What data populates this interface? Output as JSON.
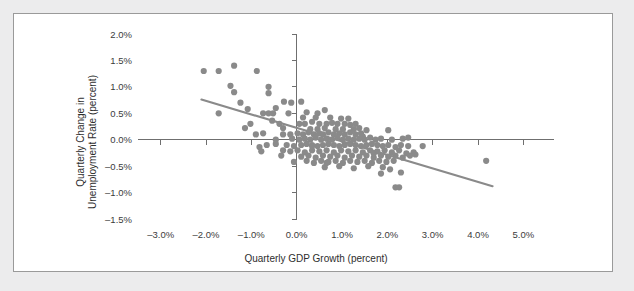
{
  "chart_data": {
    "type": "scatter",
    "title": "",
    "xlabel": "Quarterly GDP Growth (percent)",
    "ylabel_line1": "Quarterly Change in",
    "ylabel_line2": "Unemployment Rate (percent)",
    "xlim": [
      -3.5,
      5.5
    ],
    "ylim": [
      -1.5,
      2.0
    ],
    "grid": false,
    "legend": "none",
    "xticks": [
      -3.0,
      -2.0,
      -1.0,
      0.0,
      1.0,
      2.0,
      3.0,
      4.0,
      5.0
    ],
    "xtick_labels": [
      "–3.0%",
      "–2.0%",
      "–1.0%",
      "0.0%",
      "1.0%",
      "2.0%",
      "3.0%",
      "4.0%",
      "5.0%"
    ],
    "yticks": [
      -1.5,
      -1.0,
      -0.5,
      0.0,
      0.5,
      1.0,
      1.5,
      2.0
    ],
    "ytick_labels": [
      "–1.5%",
      "–1.0%",
      "–0.5%",
      "0.0%",
      "0.5%",
      "1.0%",
      "1.5%",
      "2.0%"
    ],
    "marker_color": "#8a8a8a",
    "marker_size": 3.1,
    "axis_color": "#6f6f6f",
    "trendline": {
      "color": "#8a8a8a",
      "x_start": -2.1,
      "y_start": 0.76,
      "x_end": 4.32,
      "y_end": -0.88
    },
    "points": [
      [
        -2.05,
        1.3
      ],
      [
        -1.72,
        1.3
      ],
      [
        -1.38,
        1.4
      ],
      [
        -0.88,
        1.3
      ],
      [
        -1.46,
        1.02
      ],
      [
        -1.38,
        0.9
      ],
      [
        -0.62,
        1.0
      ],
      [
        -0.62,
        0.88
      ],
      [
        -1.24,
        0.7
      ],
      [
        -0.28,
        0.72
      ],
      [
        -0.12,
        0.7
      ],
      [
        0.1,
        0.72
      ],
      [
        -1.72,
        0.5
      ],
      [
        -1.08,
        0.58
      ],
      [
        -0.74,
        0.5
      ],
      [
        -0.62,
        0.5
      ],
      [
        -0.52,
        0.5
      ],
      [
        -0.18,
        0.5
      ],
      [
        0.22,
        0.52
      ],
      [
        0.46,
        0.5
      ],
      [
        0.62,
        0.56
      ],
      [
        -1.02,
        0.3
      ],
      [
        -0.38,
        0.3
      ],
      [
        -0.3,
        0.22
      ],
      [
        0.06,
        0.3
      ],
      [
        0.18,
        0.3
      ],
      [
        0.34,
        0.34
      ],
      [
        0.5,
        0.3
      ],
      [
        0.66,
        0.3
      ],
      [
        0.78,
        0.32
      ],
      [
        0.9,
        0.3
      ],
      [
        1.06,
        0.3
      ],
      [
        1.18,
        0.28
      ],
      [
        1.3,
        0.3
      ],
      [
        0.42,
        0.42
      ],
      [
        0.74,
        0.42
      ],
      [
        0.98,
        0.4
      ],
      [
        1.14,
        0.4
      ],
      [
        -0.9,
        0.1
      ],
      [
        -0.74,
        0.12
      ],
      [
        -0.3,
        0.1
      ],
      [
        -0.14,
        0.1
      ],
      [
        0.02,
        0.12
      ],
      [
        0.14,
        0.1
      ],
      [
        0.26,
        0.14
      ],
      [
        0.38,
        0.1
      ],
      [
        0.5,
        0.12
      ],
      [
        0.58,
        0.1
      ],
      [
        0.7,
        0.14
      ],
      [
        0.82,
        0.1
      ],
      [
        0.94,
        0.12
      ],
      [
        1.06,
        0.1
      ],
      [
        1.18,
        0.14
      ],
      [
        1.3,
        0.1
      ],
      [
        1.42,
        0.12
      ],
      [
        1.54,
        0.18
      ],
      [
        0.3,
        0.2
      ],
      [
        0.46,
        0.2
      ],
      [
        0.62,
        0.22
      ],
      [
        0.86,
        0.2
      ],
      [
        1.02,
        0.2
      ],
      [
        1.26,
        0.2
      ],
      [
        1.38,
        0.22
      ],
      [
        2.02,
        0.18
      ],
      [
        -0.1,
        0.02
      ],
      [
        0.06,
        0.0
      ],
      [
        0.18,
        0.02
      ],
      [
        0.3,
        0.0
      ],
      [
        0.42,
        0.04
      ],
      [
        0.54,
        0.0
      ],
      [
        0.66,
        0.02
      ],
      [
        0.78,
        0.0
      ],
      [
        0.9,
        0.04
      ],
      [
        1.02,
        0.0
      ],
      [
        1.14,
        0.02
      ],
      [
        1.26,
        0.0
      ],
      [
        1.38,
        0.02
      ],
      [
        1.5,
        0.0
      ],
      [
        1.62,
        0.04
      ],
      [
        1.74,
        0.0
      ],
      [
        1.86,
        0.02
      ],
      [
        2.1,
        0.0
      ],
      [
        2.34,
        0.02
      ],
      [
        -0.46,
        0.0
      ],
      [
        -0.66,
        -0.1
      ],
      [
        -0.46,
        -0.08
      ],
      [
        -0.22,
        -0.1
      ],
      [
        -0.06,
        -0.12
      ],
      [
        0.1,
        -0.1
      ],
      [
        0.22,
        -0.08
      ],
      [
        0.34,
        -0.1
      ],
      [
        0.46,
        -0.12
      ],
      [
        0.58,
        -0.1
      ],
      [
        0.7,
        -0.08
      ],
      [
        0.82,
        -0.1
      ],
      [
        0.94,
        -0.12
      ],
      [
        1.06,
        -0.1
      ],
      [
        1.18,
        -0.08
      ],
      [
        1.3,
        -0.1
      ],
      [
        1.42,
        -0.12
      ],
      [
        1.54,
        -0.1
      ],
      [
        1.66,
        -0.08
      ],
      [
        1.78,
        -0.1
      ],
      [
        1.9,
        -0.12
      ],
      [
        2.02,
        -0.1
      ],
      [
        2.18,
        -0.14
      ],
      [
        2.3,
        -0.1
      ],
      [
        2.46,
        -0.12
      ],
      [
        2.78,
        -0.12
      ],
      [
        -0.78,
        -0.22
      ],
      [
        -0.3,
        -0.2
      ],
      [
        -0.14,
        -0.22
      ],
      [
        0.02,
        -0.2
      ],
      [
        0.18,
        -0.24
      ],
      [
        0.34,
        -0.2
      ],
      [
        0.5,
        -0.22
      ],
      [
        0.66,
        -0.2
      ],
      [
        0.82,
        -0.24
      ],
      [
        0.98,
        -0.2
      ],
      [
        1.14,
        -0.22
      ],
      [
        1.3,
        -0.2
      ],
      [
        1.46,
        -0.24
      ],
      [
        1.62,
        -0.2
      ],
      [
        1.78,
        -0.22
      ],
      [
        1.94,
        -0.2
      ],
      [
        2.1,
        -0.24
      ],
      [
        2.26,
        -0.2
      ],
      [
        2.42,
        -0.26
      ],
      [
        2.58,
        -0.24
      ],
      [
        0.1,
        -0.32
      ],
      [
        0.26,
        -0.3
      ],
      [
        0.42,
        -0.34
      ],
      [
        0.58,
        -0.3
      ],
      [
        0.74,
        -0.32
      ],
      [
        0.9,
        -0.3
      ],
      [
        1.06,
        -0.34
      ],
      [
        1.22,
        -0.3
      ],
      [
        1.38,
        -0.32
      ],
      [
        1.54,
        -0.3
      ],
      [
        1.7,
        -0.34
      ],
      [
        1.86,
        -0.3
      ],
      [
        2.02,
        -0.32
      ],
      [
        2.18,
        -0.3
      ],
      [
        2.34,
        -0.34
      ],
      [
        2.5,
        -0.3
      ],
      [
        4.18,
        -0.4
      ],
      [
        -0.06,
        -0.42
      ],
      [
        0.22,
        -0.4
      ],
      [
        0.38,
        -0.44
      ],
      [
        0.54,
        -0.4
      ],
      [
        0.7,
        -0.42
      ],
      [
        0.86,
        -0.4
      ],
      [
        1.02,
        -0.44
      ],
      [
        1.18,
        -0.4
      ],
      [
        1.34,
        -0.42
      ],
      [
        1.5,
        -0.4
      ],
      [
        1.66,
        -0.44
      ],
      [
        1.82,
        -0.4
      ],
      [
        1.98,
        -0.42
      ],
      [
        2.14,
        -0.4
      ],
      [
        0.62,
        -0.52
      ],
      [
        0.94,
        -0.5
      ],
      [
        1.26,
        -0.54
      ],
      [
        1.58,
        -0.5
      ],
      [
        1.9,
        -0.52
      ],
      [
        2.06,
        -0.56
      ],
      [
        2.3,
        -0.62
      ],
      [
        1.86,
        -0.64
      ],
      [
        2.18,
        -0.9
      ],
      [
        2.26,
        -0.9
      ],
      [
        0.34,
        -0.12
      ],
      [
        0.66,
        -0.44
      ],
      [
        1.46,
        0.06
      ],
      [
        1.7,
        -0.26
      ],
      [
        -0.54,
        0.36
      ],
      [
        -0.46,
        0.6
      ],
      [
        -1.14,
        0.22
      ],
      [
        -0.82,
        -0.14
      ],
      [
        -0.34,
        -0.3
      ],
      [
        0.14,
        0.42
      ],
      [
        2.62,
        -0.28
      ],
      [
        2.46,
        0.04
      ]
    ]
  }
}
